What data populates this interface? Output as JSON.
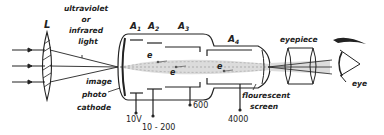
{
  "diagram": {
    "lens_label": "L",
    "light_label": [
      "ultraviolet",
      "or",
      "infrared",
      "light"
    ],
    "image_label": "image",
    "photocathode_label": [
      "photo",
      "cathode"
    ],
    "anodes": [
      {
        "label": "A",
        "sub": "1",
        "voltage": "10V"
      },
      {
        "label": "A",
        "sub": "2",
        "voltage": "10 - 200"
      },
      {
        "label": "A",
        "sub": "3",
        "voltage": "600"
      },
      {
        "label": "A",
        "sub": "4",
        "voltage": "4000"
      }
    ],
    "electron_label": "e",
    "screen_label": [
      "flourescent",
      "screen"
    ],
    "eyepiece_label": "eyepiece",
    "eye_label": "eye",
    "colors": {
      "ink": "#222222",
      "beam": "#d8d8d8",
      "background": "#ffffff"
    }
  }
}
